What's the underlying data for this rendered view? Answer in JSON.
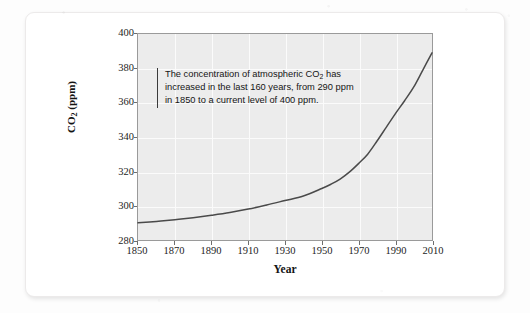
{
  "figure": {
    "annotation_text_line1": "The concentration of atmospheric CO",
    "annotation_sub": "2",
    "annotation_text_rest": " has increased in the last 160 years, from 290 ppm in 1850 to a current level of 400 ppm.",
    "annotation_full": "The concentration of atmospheric CO2 has increased in the last 160 years, from 290 ppm in 1850 to a current level of 400 ppm."
  },
  "chart_data": {
    "type": "line",
    "title": "",
    "xlabel": "Year",
    "ylabel_main": "CO",
    "ylabel_sub": "2",
    "ylabel_unit": " (ppm)",
    "ylabel": "CO2 (ppm)",
    "xlim": [
      1850,
      2010
    ],
    "ylim": [
      280,
      400
    ],
    "grid": true,
    "legend": "none",
    "xticks": [
      1850,
      1870,
      1890,
      1910,
      1930,
      1950,
      1970,
      1990,
      2010
    ],
    "yticks": [
      280,
      300,
      320,
      340,
      360,
      380,
      400
    ],
    "series": [
      {
        "name": "Atmospheric CO2 concentration",
        "color": "#4a4a4a",
        "x": [
          1850,
          1860,
          1870,
          1880,
          1890,
          1900,
          1910,
          1920,
          1930,
          1940,
          1950,
          1955,
          1960,
          1965,
          1970,
          1975,
          1980,
          1985,
          1990,
          1995,
          2000,
          2005,
          2010
        ],
        "values": [
          290.0,
          290.8,
          291.8,
          293.0,
          294.4,
          296.0,
          298.0,
          300.4,
          303.0,
          305.6,
          310.0,
          312.5,
          315.5,
          319.5,
          324.5,
          330.0,
          337.5,
          345.5,
          353.5,
          361.0,
          369.0,
          379.0,
          389.0
        ]
      }
    ],
    "annotations": [
      {
        "text": "The concentration of atmospheric CO2 has increased in the last 160 years, from 290 ppm in 1850 to a current level of 400 ppm.",
        "x": 1862,
        "y": 368
      }
    ]
  }
}
